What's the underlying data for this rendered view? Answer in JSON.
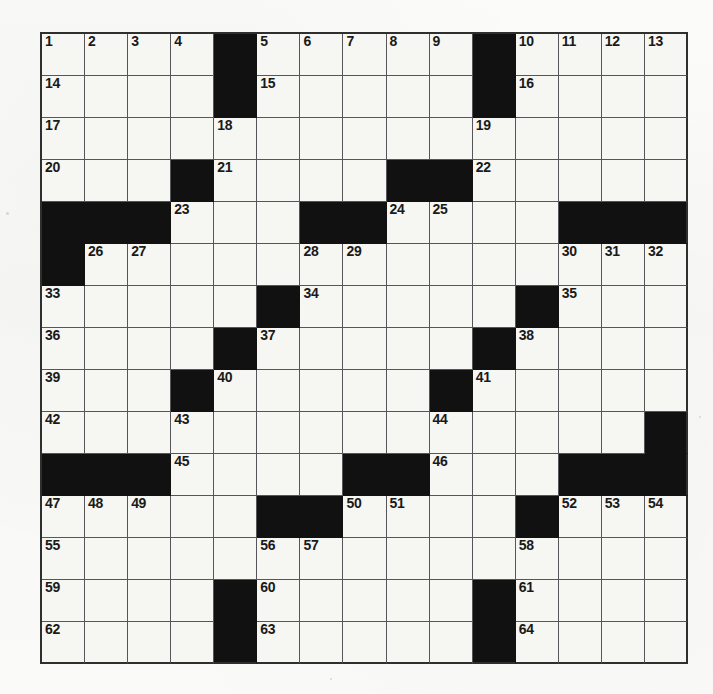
{
  "puzzle": {
    "type": "crossword-grid",
    "rows": 15,
    "columns": 15,
    "colors": {
      "block": "#111111",
      "cell": "#f6f6f3",
      "grid_line": "#55555a",
      "frame": "#2f2f2f",
      "number_text": "#1a1a1a",
      "paper": "#fafaf8"
    },
    "max_clue_number": 64,
    "grid": [
      {
        "row": 1,
        "blocks": [
          4,
          10
        ],
        "numbers": {
          "0": "1",
          "1": "2",
          "2": "3",
          "3": "4",
          "5": "5",
          "6": "6",
          "7": "7",
          "8": "8",
          "9": "9",
          "11": "10",
          "12": "11",
          "13": "12",
          "14": "13"
        }
      },
      {
        "row": 2,
        "blocks": [
          4,
          10
        ],
        "numbers": {
          "0": "14",
          "5": "15",
          "11": "16"
        }
      },
      {
        "row": 3,
        "blocks": [],
        "numbers": {
          "0": "17",
          "4": "18",
          "10": "19"
        }
      },
      {
        "row": 4,
        "blocks": [
          3,
          8,
          9
        ],
        "numbers": {
          "0": "20",
          "4": "21",
          "10": "22"
        }
      },
      {
        "row": 5,
        "blocks": [
          0,
          1,
          2,
          6,
          7,
          12,
          13,
          14
        ],
        "numbers": {
          "3": "23",
          "8": "24",
          "9": "25"
        }
      },
      {
        "row": 6,
        "blocks": [
          0
        ],
        "numbers": {
          "1": "26",
          "2": "27",
          "6": "28",
          "7": "29",
          "12": "30",
          "13": "31",
          "14": "32"
        }
      },
      {
        "row": 7,
        "blocks": [
          5,
          11
        ],
        "numbers": {
          "0": "33",
          "6": "34",
          "12": "35"
        }
      },
      {
        "row": 8,
        "blocks": [
          4,
          10
        ],
        "numbers": {
          "0": "36",
          "5": "37",
          "11": "38"
        }
      },
      {
        "row": 9,
        "blocks": [
          3,
          9
        ],
        "numbers": {
          "0": "39",
          "4": "40",
          "10": "41"
        }
      },
      {
        "row": 10,
        "blocks": [
          14
        ],
        "numbers": {
          "0": "42",
          "3": "43",
          "9": "44"
        }
      },
      {
        "row": 11,
        "blocks": [
          0,
          1,
          2,
          7,
          8,
          12,
          13,
          14
        ],
        "numbers": {
          "3": "45",
          "9": "46"
        }
      },
      {
        "row": 12,
        "blocks": [
          5,
          6,
          11
        ],
        "numbers": {
          "0": "47",
          "1": "48",
          "2": "49",
          "7": "50",
          "8": "51",
          "12": "52",
          "13": "53",
          "14": "54"
        }
      },
      {
        "row": 13,
        "blocks": [],
        "numbers": {
          "0": "55",
          "5": "56",
          "6": "57",
          "11": "58"
        }
      },
      {
        "row": 14,
        "blocks": [
          4,
          10
        ],
        "numbers": {
          "0": "59",
          "5": "60",
          "11": "61"
        }
      },
      {
        "row": 15,
        "blocks": [
          4,
          10
        ],
        "numbers": {
          "0": "62",
          "5": "63",
          "11": "64"
        }
      }
    ]
  }
}
